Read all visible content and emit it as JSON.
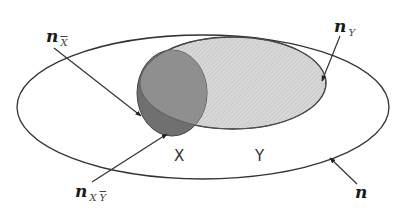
{
  "diagram": {
    "type": "venn",
    "colors": {
      "outline": "#333333",
      "universe_fill": "#ffffff",
      "y_fill": "#d4d4d4",
      "x_fill": "#8e8e8e",
      "x_not_y_fill": "#707070",
      "arrow": "#333333"
    },
    "sets": {
      "x_label": "X",
      "y_label": "Y"
    },
    "labels": {
      "n_x_bar": {
        "main": "n",
        "sub": "X"
      },
      "n_y": {
        "main": "n",
        "sub": "Y"
      },
      "n_x_y_bar": {
        "main": "n",
        "sub_x": "X",
        "sub_y": "Y"
      },
      "n_total": {
        "main": "n"
      }
    }
  }
}
